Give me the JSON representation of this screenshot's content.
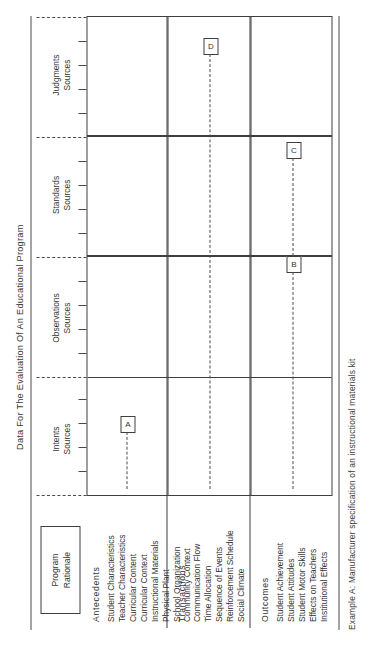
{
  "figure": {
    "title": "Data For The Evaluation Of An Educational Program",
    "caption": "Example A: Manufacturer specification of an instructional materials kit"
  },
  "program_box": {
    "line1": "Program",
    "line2": "Rationale"
  },
  "columns": [
    {
      "id": "intents",
      "line1": "Intents",
      "line2": "Sources"
    },
    {
      "id": "observations",
      "line1": "Observations",
      "line2": "Sources"
    },
    {
      "id": "standards",
      "line1": "Standards",
      "line2": "Sources"
    },
    {
      "id": "judgments",
      "line1": "Judgments",
      "line2": "Sources"
    }
  ],
  "rows": [
    {
      "id": "antecedents",
      "title": "Antecedents",
      "items": [
        "Student Characteristics",
        "Teacher Characteristics",
        "Curricular Content",
        "Curricular Context",
        "Instructional Materials",
        "Physical Plant",
        "School Organization",
        "Community Context"
      ]
    },
    {
      "id": "transactions",
      "title": "Transactions",
      "items": [
        "Communication Flow",
        "Time Allocation",
        "Sequence of Events",
        "Reinforcement Schedule",
        "Social Climate"
      ]
    },
    {
      "id": "outcomes",
      "title": "Outcomes",
      "items": [
        "Student Achievement",
        "Student Attitudes",
        "Student Motor Skills",
        "Effects on Teachers",
        "Institutional Effects"
      ]
    }
  ],
  "markers": [
    {
      "id": "a",
      "label": "A"
    },
    {
      "id": "b",
      "label": "B"
    },
    {
      "id": "c",
      "label": "C"
    },
    {
      "id": "d",
      "label": "D"
    }
  ],
  "colors": {
    "ink": "#3f3f3f",
    "text": "#333333",
    "paper": "#ffffff"
  }
}
